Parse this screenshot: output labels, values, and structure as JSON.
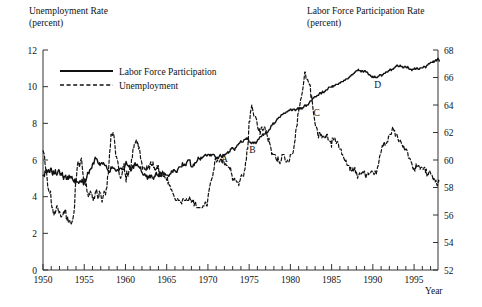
{
  "chart_data": {
    "type": "line",
    "title": "",
    "left_axis": {
      "label": "Unemployment Rate",
      "units": "(percent)",
      "ticks": [
        0,
        2,
        4,
        6,
        8,
        10,
        12
      ],
      "ylim": [
        0,
        12
      ]
    },
    "right_axis": {
      "label": "Labor Force Participation Rate",
      "units": "(percent)",
      "ticks": [
        52,
        54,
        56,
        58,
        60,
        62,
        64,
        66,
        68
      ],
      "ylim": [
        52,
        68
      ]
    },
    "xlabel": "Year",
    "xlim": [
      1950,
      1997.9
    ],
    "xticks_major": [
      1950,
      1955,
      1960,
      1965,
      1970,
      1975,
      1980,
      1985,
      1990,
      1995
    ],
    "xtick_minor_step": 1,
    "grid": false,
    "legend": {
      "position": "top-left-inside",
      "entries": [
        {
          "name": "Labor Force Participation",
          "style": "solid",
          "axis": "right"
        },
        {
          "name": "Unemployment",
          "style": "dashed",
          "axis": "left"
        }
      ]
    },
    "annotations": [
      {
        "text": "A",
        "x": 1972.0,
        "y_px": 162
      },
      {
        "text": "B",
        "x": 1975.4,
        "y_px": 153
      },
      {
        "text": "C",
        "x": 1983.2,
        "y_px": 116
      },
      {
        "text": "D",
        "x": 1990.6,
        "y_px": 88
      }
    ],
    "series": [
      {
        "name": "Unemployment",
        "axis": "left",
        "style": "dashed",
        "units": "percent",
        "x_start": 1950.0,
        "x_step": 0.0833,
        "values": [
          6.5,
          6.4,
          6.3,
          5.8,
          5.5,
          5.4,
          5.0,
          4.5,
          4.4,
          4.2,
          4.2,
          4.3,
          3.7,
          3.4,
          3.4,
          3.1,
          3.0,
          3.2,
          3.1,
          3.3,
          3.5,
          3.5,
          3.3,
          3.1,
          3.2,
          3.1,
          2.9,
          2.9,
          3.0,
          3.0,
          3.2,
          3.1,
          3.3,
          3.3,
          2.8,
          2.7,
          2.9,
          2.6,
          2.6,
          2.7,
          2.5,
          2.5,
          2.6,
          2.7,
          2.9,
          3.1,
          3.5,
          4.5,
          4.9,
          5.2,
          5.7,
          5.9,
          5.9,
          5.6,
          5.8,
          6.0,
          6.1,
          5.7,
          5.3,
          5.0,
          4.9,
          4.7,
          4.6,
          4.7,
          4.3,
          4.2,
          4.0,
          4.2,
          4.1,
          4.3,
          4.2,
          4.2,
          3.9,
          3.8,
          4.0,
          3.9,
          4.2,
          4.3,
          4.4,
          4.1,
          3.9,
          3.9,
          4.3,
          4.2,
          4.2,
          3.9,
          3.7,
          3.9,
          4.1,
          4.3,
          4.2,
          4.1,
          4.4,
          4.5,
          5.1,
          5.2,
          5.8,
          6.4,
          6.7,
          7.4,
          7.4,
          7.3,
          7.5,
          7.4,
          7.1,
          6.7,
          6.2,
          6.2,
          6.0,
          5.9,
          5.6,
          5.2,
          5.1,
          5.0,
          5.1,
          5.2,
          5.5,
          5.7,
          5.8,
          5.3,
          5.2,
          4.8,
          5.4,
          5.2,
          5.1,
          5.4,
          5.5,
          5.6,
          5.5,
          6.1,
          6.1,
          6.6,
          6.6,
          6.9,
          6.9,
          7.0,
          7.1,
          6.9,
          7.0,
          6.6,
          6.7,
          6.5,
          6.1,
          6.0,
          5.8,
          5.5,
          5.6,
          5.6,
          5.5,
          5.5,
          5.4,
          5.7,
          5.5,
          5.5,
          5.7,
          5.5,
          5.8,
          5.9,
          5.7,
          5.7,
          5.9,
          5.6,
          5.6,
          5.4,
          5.5,
          5.5,
          5.7,
          5.5,
          5.7,
          5.2,
          5.4,
          5.3,
          5.1,
          5.4,
          5.4,
          5.1,
          5.1,
          5.1,
          5.0,
          5.0,
          4.9,
          5.1,
          4.7,
          4.8,
          4.6,
          4.6,
          4.4,
          4.4,
          4.3,
          4.2,
          4.1,
          4.0,
          3.9,
          3.8,
          3.8,
          3.8,
          3.9,
          3.8,
          3.8,
          3.8,
          3.7,
          3.7,
          3.6,
          3.8,
          3.9,
          3.8,
          3.8,
          3.8,
          3.8,
          3.9,
          3.8,
          3.8,
          3.8,
          4.0,
          3.9,
          3.8,
          3.7,
          3.8,
          3.7,
          3.8,
          3.5,
          3.7,
          3.7,
          3.5,
          3.4,
          3.4,
          3.4,
          3.4,
          3.4,
          3.4,
          3.4,
          3.4,
          3.4,
          3.5,
          3.5,
          3.5,
          3.7,
          3.7,
          3.5,
          3.5,
          3.9,
          4.2,
          4.4,
          4.6,
          4.8,
          4.9,
          5.0,
          5.1,
          5.4,
          5.5,
          5.9,
          6.1,
          5.9,
          5.9,
          6.0,
          5.9,
          5.9,
          5.9,
          6.0,
          6.1,
          6.0,
          5.8,
          6.0,
          6.0,
          5.8,
          5.7,
          5.8,
          5.7,
          5.7,
          5.7,
          5.6,
          5.6,
          5.5,
          5.6,
          5.3,
          5.2,
          4.9,
          5.0,
          4.9,
          5.0,
          4.9,
          4.9,
          4.8,
          4.8,
          4.8,
          4.6,
          4.8,
          4.9,
          5.1,
          5.2,
          5.1,
          5.1,
          5.1,
          5.4,
          5.5,
          5.9,
          6.0,
          6.6,
          6.6,
          7.2,
          8.1,
          8.1,
          8.6,
          8.8,
          9.0,
          8.8,
          8.6,
          8.4,
          8.4,
          8.4,
          8.3,
          8.2,
          7.9,
          7.7,
          7.6,
          7.7,
          7.4,
          7.6,
          7.8,
          7.8,
          7.6,
          7.7,
          7.8,
          7.8,
          7.5,
          7.6,
          7.4,
          7.2,
          7.0,
          7.2,
          6.9,
          6.8,
          6.6,
          6.3,
          6.4,
          6.3,
          6.3,
          6.3,
          6.3,
          6.1,
          6.0,
          5.9,
          6.2,
          5.9,
          5.9,
          5.8,
          5.9,
          6.0,
          6.3,
          6.3,
          6.3,
          6.3,
          6.1,
          5.9,
          5.9,
          5.9,
          6.0,
          6.0,
          5.9,
          6.0,
          6.3,
          6.3,
          6.3,
          6.3,
          6.4,
          6.6,
          6.9,
          7.1,
          7.6,
          7.8,
          7.9,
          8.5,
          8.6,
          8.9,
          9.0,
          9.3,
          9.4,
          9.6,
          9.8,
          10.1,
          10.4,
          10.8,
          10.8,
          10.4,
          10.4,
          10.4,
          10.3,
          10.2,
          10.1,
          10.1,
          9.4,
          9.5,
          9.2,
          8.8,
          8.5,
          8.3,
          8.0,
          7.8,
          7.8,
          7.7,
          7.4,
          7.2,
          7.5,
          7.5,
          7.3,
          7.4,
          7.2,
          7.3,
          7.3,
          7.2,
          7.2,
          7.3,
          7.2,
          7.4,
          7.4,
          7.1,
          7.1,
          7.1,
          7.0,
          7.0,
          6.7,
          7.2,
          7.2,
          7.1,
          7.2,
          7.2,
          7.0,
          6.9,
          7.0,
          7.0,
          6.9,
          6.6,
          6.6,
          6.6,
          6.6,
          6.3,
          6.3,
          6.2,
          6.1,
          6.0,
          5.9,
          6.0,
          5.8,
          5.7,
          5.7,
          5.7,
          5.7,
          5.4,
          5.6,
          5.4,
          5.4,
          5.6,
          5.4,
          5.4,
          5.6,
          5.3,
          5.4,
          5.2,
          5.0,
          5.2,
          5.2,
          5.3,
          5.2,
          5.2,
          5.3,
          5.3,
          5.4,
          5.3,
          5.4,
          5.2,
          5.0,
          5.2,
          5.2,
          5.3,
          5.2,
          5.3,
          5.3,
          5.3,
          5.4,
          5.4,
          5.3,
          5.3,
          5.2,
          5.4,
          5.4,
          5.2,
          5.4,
          5.6,
          5.7,
          5.9,
          6.2,
          6.3,
          6.4,
          6.6,
          6.8,
          6.7,
          6.9,
          7.0,
          6.8,
          6.9,
          6.9,
          7.0,
          7.0,
          7.3,
          7.3,
          7.4,
          7.4,
          7.4,
          7.6,
          7.8,
          7.7,
          7.6,
          7.6,
          7.3,
          7.4,
          7.4,
          7.3,
          7.1,
          7.0,
          7.1,
          7.1,
          7.0,
          6.9,
          6.8,
          6.7,
          6.8,
          6.6,
          6.5,
          6.6,
          6.6,
          6.5,
          6.4,
          6.1,
          6.1,
          6.1,
          6.0,
          5.9,
          5.8,
          5.6,
          5.5,
          5.6,
          5.4,
          5.4,
          5.8,
          5.6,
          5.6,
          5.7,
          5.7,
          5.6,
          5.5,
          5.6,
          5.6,
          5.6,
          5.5,
          5.5,
          5.6,
          5.6,
          5.3,
          5.5,
          5.1,
          5.2,
          5.2,
          5.4,
          5.4,
          5.3,
          5.2,
          5.2,
          5.1,
          4.9,
          5.0,
          4.9,
          4.8,
          4.9,
          4.7,
          4.6,
          4.7,
          4.9,
          4.8
        ]
      },
      {
        "name": "Labor Force Participation",
        "axis": "right",
        "style": "solid",
        "units": "percent",
        "x_start": 1950.0,
        "x_step": 0.0833,
        "values": [
          58.9,
          58.9,
          58.8,
          59.2,
          59.1,
          59.3,
          59.1,
          59.2,
          59.3,
          59.1,
          59.1,
          59.4,
          59.4,
          59.1,
          58.9,
          59.2,
          59.0,
          59.0,
          59.3,
          59.0,
          58.9,
          59.0,
          59.2,
          59.3,
          59.2,
          58.9,
          59.0,
          58.9,
          59.1,
          58.8,
          58.6,
          58.8,
          58.8,
          58.9,
          58.6,
          58.6,
          58.8,
          58.6,
          58.9,
          58.7,
          58.8,
          58.7,
          58.8,
          58.6,
          58.5,
          58.4,
          58.6,
          58.3,
          58.6,
          58.4,
          58.4,
          58.4,
          58.3,
          58.4,
          58.5,
          58.4,
          58.4,
          58.6,
          58.4,
          58.2,
          58.6,
          58.6,
          58.4,
          58.6,
          58.8,
          59.1,
          59.1,
          59.0,
          59.3,
          59.3,
          59.4,
          59.4,
          59.7,
          59.8,
          59.7,
          60.0,
          60.2,
          60.1,
          60.1,
          60.0,
          59.8,
          59.7,
          59.8,
          59.6,
          59.7,
          59.8,
          59.8,
          59.7,
          59.8,
          59.7,
          59.6,
          59.6,
          59.6,
          59.4,
          59.3,
          59.2,
          59.2,
          59.1,
          59.2,
          59.5,
          59.4,
          59.5,
          59.4,
          59.4,
          59.4,
          59.3,
          59.2,
          59.2,
          59.3,
          59.3,
          59.2,
          59.3,
          59.4,
          59.4,
          59.4,
          59.3,
          59.3,
          59.3,
          59.3,
          59.5,
          59.7,
          59.9,
          59.7,
          59.6,
          59.6,
          59.5,
          59.6,
          59.4,
          59.2,
          59.3,
          59.5,
          59.6,
          59.4,
          59.7,
          59.8,
          59.6,
          59.6,
          59.7,
          59.6,
          59.5,
          59.5,
          59.4,
          59.5,
          59.2,
          59.1,
          59.0,
          58.9,
          58.9,
          59.0,
          58.9,
          58.8,
          58.9,
          58.6,
          58.8,
          58.7,
          58.9,
          58.7,
          58.9,
          58.9,
          58.7,
          58.7,
          58.6,
          58.8,
          58.8,
          59.0,
          59.1,
          58.9,
          58.9,
          58.8,
          59.0,
          58.8,
          58.9,
          58.8,
          58.9,
          58.9,
          58.9,
          59.1,
          58.9,
          59.0,
          58.9,
          58.9,
          58.9,
          58.9,
          58.8,
          58.9,
          59.0,
          59.0,
          59.2,
          59.2,
          59.1,
          59.3,
          59.3,
          59.2,
          59.2,
          59.1,
          59.1,
          59.3,
          59.4,
          59.5,
          59.5,
          59.5,
          59.5,
          59.5,
          59.8,
          59.6,
          59.6,
          59.7,
          59.6,
          59.6,
          59.8,
          59.9,
          60.0,
          60.0,
          60.0,
          60.0,
          59.6,
          59.5,
          59.5,
          59.5,
          59.7,
          59.6,
          59.8,
          59.8,
          59.8,
          59.9,
          60.0,
          60.2,
          60.1,
          60.1,
          60.0,
          60.2,
          60.1,
          60.2,
          60.2,
          60.3,
          60.3,
          60.4,
          60.4,
          60.3,
          60.3,
          60.4,
          60.4,
          60.4,
          60.3,
          60.4,
          60.3,
          60.4,
          60.4,
          60.4,
          60.4,
          60.3,
          60.2,
          60.2,
          60.1,
          60.2,
          60.1,
          60.2,
          60.3,
          60.4,
          60.3,
          60.2,
          60.2,
          60.4,
          60.3,
          60.4,
          60.4,
          60.4,
          60.5,
          60.5,
          60.6,
          60.5,
          60.6,
          60.6,
          60.8,
          60.8,
          60.9,
          60.9,
          60.8,
          60.8,
          60.7,
          60.9,
          60.9,
          61.0,
          61.1,
          61.1,
          61.2,
          61.2,
          61.3,
          61.4,
          61.3,
          61.3,
          61.3,
          61.4,
          61.5,
          61.5,
          61.5,
          61.6,
          61.5,
          61.6,
          61.5,
          61.3,
          61.3,
          61.3,
          61.2,
          61.2,
          61.3,
          61.3,
          61.2,
          61.3,
          61.3,
          61.2,
          61.3,
          61.4,
          61.5,
          61.5,
          61.6,
          61.7,
          61.7,
          61.7,
          61.8,
          61.9,
          61.8,
          61.9,
          61.9,
          61.9,
          62.0,
          62.0,
          62.0,
          62.1,
          62.2,
          62.2,
          62.3,
          62.5,
          62.5,
          62.6,
          62.7,
          62.6,
          62.7,
          62.7,
          62.8,
          62.9,
          63.0,
          63.0,
          63.1,
          63.1,
          63.1,
          63.2,
          63.3,
          63.3,
          63.3,
          63.4,
          63.4,
          63.4,
          63.4,
          63.5,
          63.5,
          63.5,
          63.6,
          63.6,
          63.6,
          63.7,
          63.7,
          63.6,
          63.6,
          63.7,
          63.7,
          63.7,
          63.6,
          63.6,
          63.7,
          63.7,
          63.8,
          63.7,
          63.8,
          63.7,
          63.8,
          63.8,
          63.7,
          63.8,
          63.8,
          63.9,
          64.0,
          64.0,
          63.9,
          64.0,
          64.0,
          64.0,
          64.1,
          64.2,
          64.3,
          64.3,
          64.3,
          64.4,
          64.5,
          64.5,
          64.6,
          64.6,
          64.6,
          64.6,
          64.7,
          64.7,
          64.7,
          64.8,
          64.9,
          64.9,
          64.8,
          64.9,
          65.0,
          64.9,
          64.9,
          65.0,
          65.0,
          65.1,
          65.1,
          65.1,
          65.2,
          65.3,
          65.3,
          65.3,
          65.3,
          65.3,
          65.4,
          65.3,
          65.4,
          65.4,
          65.4,
          65.5,
          65.5,
          65.5,
          65.5,
          65.5,
          65.6,
          65.6,
          65.6,
          65.7,
          65.7,
          65.7,
          65.7,
          65.8,
          65.8,
          65.8,
          65.9,
          65.9,
          65.9,
          65.9,
          66.0,
          66.0,
          66.1,
          66.1,
          66.2,
          66.2,
          66.2,
          66.3,
          66.3,
          66.4,
          66.4,
          66.5,
          66.5,
          66.5,
          66.6,
          66.5,
          66.5,
          66.5,
          66.4,
          66.5,
          66.5,
          66.4,
          66.4,
          66.5,
          66.5,
          66.4,
          66.4,
          66.4,
          66.3,
          66.2,
          66.2,
          66.2,
          66.1,
          66.1,
          66.0,
          66.1,
          66.0,
          66.0,
          66.1,
          66.0,
          66.0,
          66.0,
          66.0,
          66.1,
          66.1,
          66.2,
          66.2,
          66.2,
          66.1,
          66.2,
          66.2,
          66.3,
          66.3,
          66.3,
          66.4,
          66.4,
          66.4,
          66.4,
          66.5,
          66.5,
          66.6,
          66.6,
          66.5,
          66.6,
          66.6,
          66.6,
          66.7,
          66.7,
          66.8,
          66.8,
          66.9,
          66.9,
          66.8,
          66.8,
          66.8,
          66.9,
          66.8,
          66.8,
          66.8,
          66.7,
          66.7,
          66.8,
          66.8,
          66.8,
          66.7,
          66.7,
          66.8,
          66.7,
          66.6,
          66.6,
          66.6,
          66.6,
          66.5,
          66.6,
          66.6,
          66.6,
          66.7,
          66.6,
          66.6,
          66.7,
          66.7,
          66.6,
          66.6,
          66.6,
          66.7,
          66.7,
          66.7,
          66.7,
          66.7,
          66.8,
          66.8,
          66.8,
          66.7,
          66.8,
          66.9,
          66.9,
          67.0,
          67.0,
          67.0,
          67.1,
          67.1,
          67.1,
          67.1,
          67.2,
          67.1,
          67.2,
          67.2,
          67.3,
          67.2,
          67.3,
          67.4,
          67.3,
          67.2
        ]
      }
    ]
  }
}
